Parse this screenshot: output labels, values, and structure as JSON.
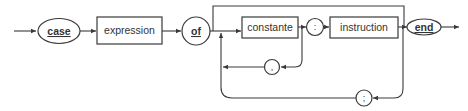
{
  "diagram": {
    "type": "syntax-diagram",
    "nodes": {
      "case": {
        "label": "case",
        "kind": "keyword",
        "shape": "oval"
      },
      "expression": {
        "label": "expression",
        "kind": "non-terminal",
        "shape": "rectangle"
      },
      "of": {
        "label": "of",
        "kind": "keyword",
        "shape": "circle"
      },
      "constante": {
        "label": "constante",
        "kind": "non-terminal",
        "shape": "rectangle"
      },
      "colon": {
        "label": ":",
        "kind": "symbol",
        "shape": "circle"
      },
      "instruction": {
        "label": "instruction",
        "kind": "non-terminal",
        "shape": "rectangle"
      },
      "end": {
        "label": "end",
        "kind": "keyword",
        "shape": "oval"
      },
      "comma": {
        "label": ",",
        "kind": "symbol",
        "shape": "circle"
      },
      "semicolon": {
        "label": ";",
        "kind": "symbol",
        "shape": "circle"
      }
    },
    "edges": [
      {
        "from": "start",
        "to": "case"
      },
      {
        "from": "case",
        "to": "expression"
      },
      {
        "from": "expression",
        "to": "of"
      },
      {
        "from": "of",
        "to": "constante"
      },
      {
        "from": "of",
        "to": "end",
        "note": "bypass over the top"
      },
      {
        "from": "constante",
        "to": "colon"
      },
      {
        "from": "constante",
        "to": "comma",
        "note": "loop back"
      },
      {
        "from": "comma",
        "to": "constante"
      },
      {
        "from": "colon",
        "to": "instruction"
      },
      {
        "from": "instruction",
        "to": "end"
      },
      {
        "from": "instruction",
        "to": "semicolon",
        "note": "loop back"
      },
      {
        "from": "semicolon",
        "to": "constante"
      },
      {
        "from": "end",
        "to": "exit"
      }
    ],
    "colors": {
      "stroke": "#3a3a3a",
      "text": "#333333",
      "background": "#ffffff"
    }
  }
}
